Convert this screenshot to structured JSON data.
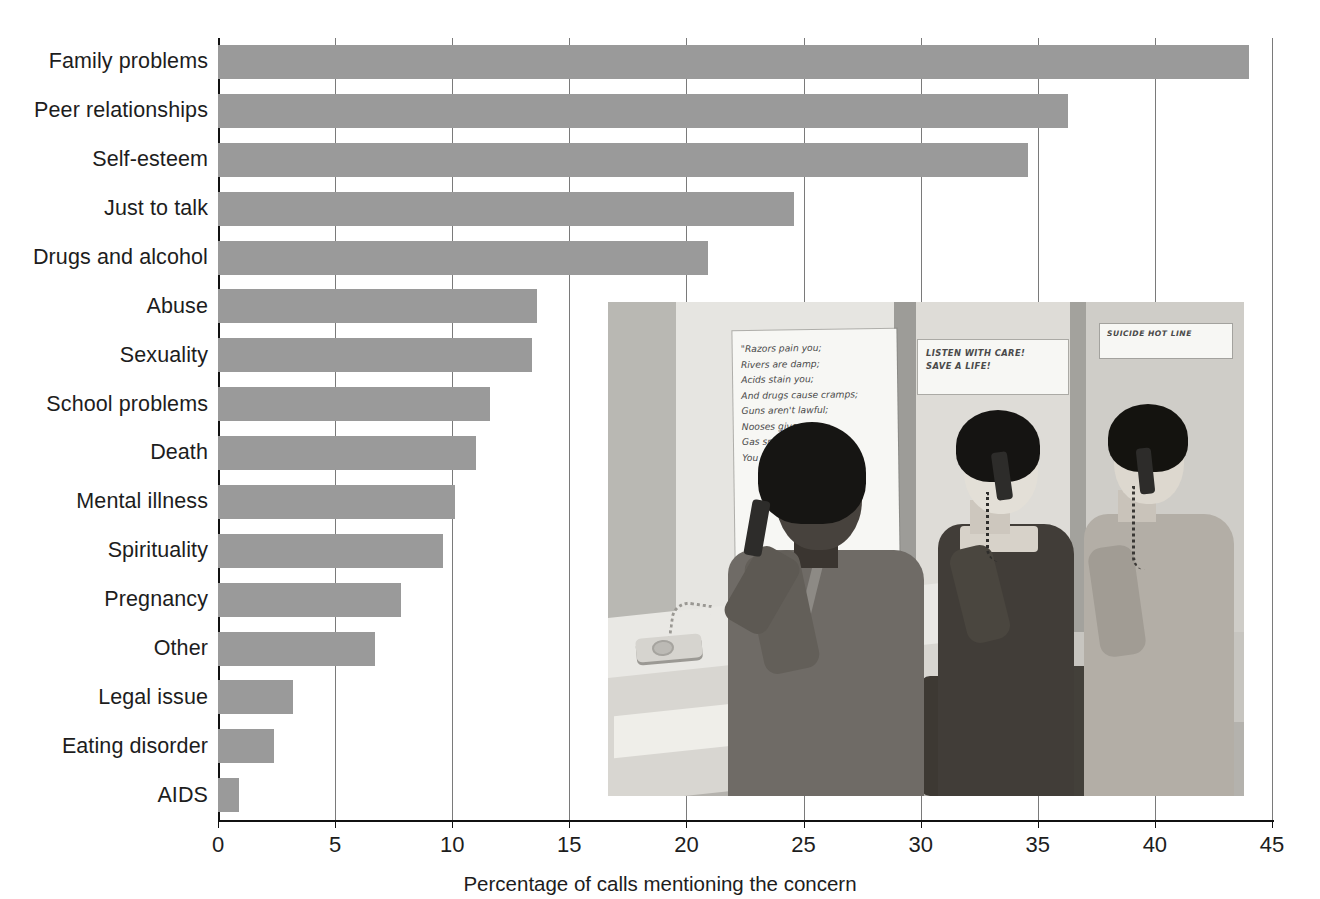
{
  "chart_data": {
    "type": "bar",
    "orientation": "horizontal",
    "title": "",
    "subtitle": "",
    "xlabel": "Percentage of calls mentioning the concern",
    "ylabel": "",
    "xlim": [
      0,
      45
    ],
    "xticks": [
      0,
      5,
      10,
      15,
      20,
      25,
      30,
      35,
      40,
      45
    ],
    "xtick_labels": [
      "0",
      "5",
      "10",
      "15",
      "20",
      "25",
      "30",
      "35",
      "40",
      "45"
    ],
    "grid": "vertical",
    "legend": "none",
    "bar_color": "#9a9a9a",
    "axis_color": "#111111",
    "gridline_color": "#7a7a7a",
    "categories": [
      "Family problems",
      "Peer relationships",
      "Self-esteem",
      "Just to talk",
      "Drugs and alcohol",
      "Abuse",
      "Sexuality",
      "School problems",
      "Death",
      "Mental illness",
      "Spirituality",
      "Pregnancy",
      "Other",
      "Legal issue",
      "Eating disorder",
      "AIDS"
    ],
    "values": [
      44.0,
      36.3,
      34.6,
      24.6,
      20.9,
      13.6,
      13.4,
      11.6,
      11.0,
      10.1,
      9.6,
      7.8,
      6.7,
      3.2,
      2.4,
      0.9
    ]
  },
  "inset_photo": {
    "caption": "",
    "description": "Black-and-white photograph of three teenage volunteers answering telephones at a crisis hot line counter",
    "signs": [
      {
        "name": "poem-poster",
        "text": "\"Razors pain you;\nRivers are damp;\nAcids stain you;\nAnd drugs cause cramps;\nGuns aren't lawful;\nNooses give;\nGas smells awful;\nYou might as well live.\""
      },
      {
        "name": "listen-poster",
        "text": "LISTEN WITH CARE!\nSAVE A LIFE!"
      },
      {
        "name": "hotline-poster",
        "text": "SUICIDE HOT LINE"
      }
    ]
  }
}
